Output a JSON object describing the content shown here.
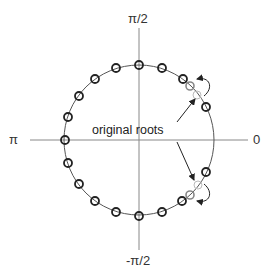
{
  "diagram": {
    "title": "",
    "axis_labels": {
      "top": "π/2",
      "bottom": "-π/2",
      "left": "π",
      "right": "0"
    },
    "annotation": "original roots",
    "unit_circle": {
      "center": [
        139,
        140
      ],
      "radius": 75,
      "stroke": "#555555"
    },
    "roots": {
      "count_total": 20,
      "spacing_deg": 18,
      "fixed_angles_deg": [
        54,
        72,
        90,
        108,
        126,
        144,
        162,
        180,
        198,
        216,
        234,
        252,
        270,
        288,
        306,
        324,
        342
      ],
      "fixed_note": "dark circles on unit circle",
      "original_moved_angles_deg": [
        36,
        -36
      ],
      "shifted_angles_deg": [
        45,
        -45
      ],
      "neighbor_dark_angles_deg": [
        26,
        -26
      ],
      "dark_color": "#222222",
      "shifted_color": "#888888",
      "original_color": "#bbbbbb"
    },
    "colors": {
      "axis": "#888888",
      "arrow": "#222222",
      "background": "#ffffff"
    }
  }
}
